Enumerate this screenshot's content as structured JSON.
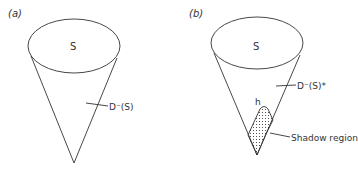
{
  "panels": [
    {
      "label": "(a)",
      "surface_label": "S",
      "domain_label": "D⁻(S)"
    },
    {
      "label": "(b)",
      "surface_label": "S",
      "domain_label": "D⁻(S)*",
      "point_label": "h",
      "shadow_label": "Shadow region"
    }
  ],
  "colors": {
    "stroke": "#333333",
    "background": "#ffffff"
  }
}
